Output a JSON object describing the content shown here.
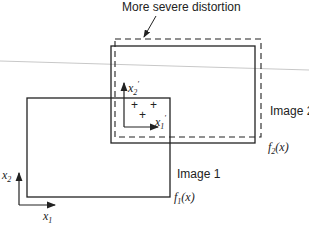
{
  "caption": "More severe distortion",
  "image1": {
    "label": "Image 1",
    "function": "f",
    "function_sub": "1",
    "function_arg": "(x)"
  },
  "image2": {
    "label": "Image 2",
    "function": "f",
    "function_sub": "2",
    "function_arg": "(x)"
  },
  "axes_global": {
    "x_label": "x",
    "x_sub": "1",
    "y_label": "x",
    "y_sub": "2"
  },
  "axes_local": {
    "x_label": "x",
    "x_sub": "1",
    "x_sup": "′",
    "y_label": "x",
    "y_sub": "2",
    "y_sup": "′"
  },
  "markers": [
    "+",
    "+",
    "+"
  ],
  "colors": {
    "line": "#222222",
    "stray_line": "#c8c8c8"
  }
}
